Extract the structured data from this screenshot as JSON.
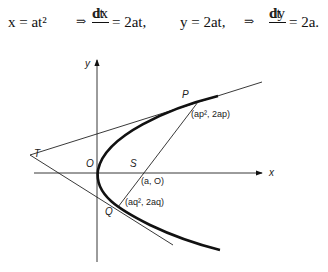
{
  "equations": {
    "x_eq": "x = at²",
    "implies1": "⇒",
    "dx_num": "dx",
    "dx_den": "dt",
    "dx_rhs": "= 2at,",
    "y_eq": "y = 2at,",
    "implies2": "⇒",
    "dy_num": "dy",
    "dy_den": "dt",
    "dy_rhs": "= 2a."
  },
  "diagram": {
    "axis_x_label": "x",
    "axis_y_label": "y",
    "point_T": "T",
    "point_O": "O",
    "point_S": "S",
    "point_P": "P",
    "point_Q": "Q",
    "coord_P": "(ap², 2ap)",
    "coord_S": "(a, O)",
    "coord_Q": "(aq², 2aq)"
  },
  "colors": {
    "ink": "#111111",
    "background": "#ffffff"
  }
}
